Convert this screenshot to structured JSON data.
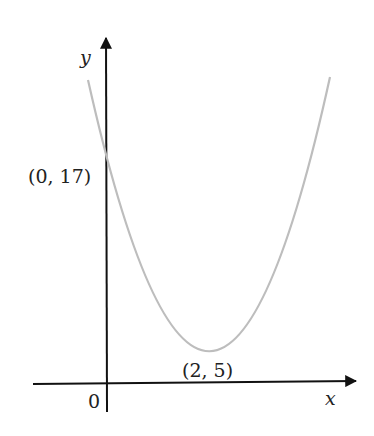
{
  "diagram": {
    "type": "parabola graph",
    "x_axis_label": "x",
    "y_axis_label": "y",
    "origin_label": "0",
    "y_intercept_label": "(0, 17)",
    "vertex_label": "(2, 5)",
    "colors": {
      "axes": "#111111",
      "curve": "#bdbdbd"
    }
  }
}
